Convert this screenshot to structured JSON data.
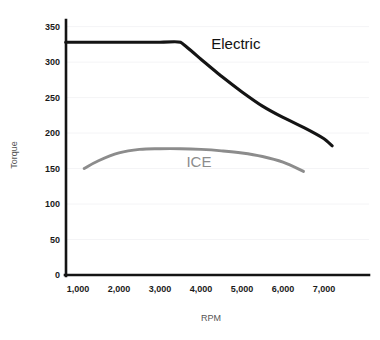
{
  "chart_data": {
    "type": "line",
    "title": "",
    "xlabel": "RPM",
    "ylabel": "Torque",
    "xlim": [
      0,
      7400
    ],
    "ylim": [
      0,
      365
    ],
    "grid": true,
    "legend_position": "inline-annotation",
    "x_tick_labels": [
      "1,000",
      "2,000",
      "3,000",
      "4,000",
      "5,000",
      "6,000",
      "7,000"
    ],
    "x_ticks": [
      1000,
      2000,
      3000,
      4000,
      5000,
      6000,
      7000
    ],
    "y_tick_labels": [
      "0",
      "50",
      "100",
      "150",
      "200",
      "250",
      "300",
      "350"
    ],
    "y_ticks": [
      0,
      50,
      100,
      150,
      200,
      250,
      300,
      350
    ],
    "series": [
      {
        "name": "Electric",
        "color": "#141414",
        "label_x": 4250,
        "label_y": 318,
        "x": [
          700,
          1000,
          1500,
          2000,
          2500,
          3000,
          3500,
          4000,
          4500,
          5000,
          5500,
          6000,
          6500,
          7000,
          7200
        ],
        "values": [
          328,
          328,
          328,
          328,
          328,
          328,
          328,
          304,
          280,
          258,
          238,
          222,
          208,
          192,
          182
        ]
      },
      {
        "name": "ICE",
        "color": "#8c8c8c",
        "label_x": 3950,
        "label_y": 152,
        "x": [
          1150,
          1500,
          2000,
          2500,
          3000,
          3500,
          4000,
          4500,
          5000,
          5500,
          6000,
          6500
        ],
        "values": [
          150,
          161,
          172,
          177,
          178,
          178,
          177,
          175,
          172,
          167,
          159,
          146
        ]
      }
    ]
  },
  "axis": {
    "y_title": "Torque",
    "x_title": "RPM"
  },
  "labels": {
    "electric": "Electric",
    "ice": "ICE"
  },
  "colors": {
    "electric": "#141414",
    "ice": "#8c8c8c",
    "axis": "#141414",
    "grid": "#f4f4f6",
    "background": "#ffffff"
  }
}
